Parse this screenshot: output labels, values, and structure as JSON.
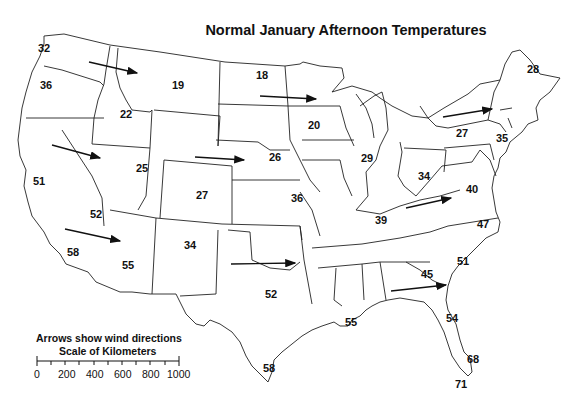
{
  "title": "Normal January Afternoon Temperatures",
  "legend": {
    "note": "Arrows show wind directions",
    "scale_title": "Scale of Kilometers",
    "scale_ticks": [
      "0",
      "200",
      "400",
      "600",
      "800",
      "1000"
    ]
  },
  "temperatures": [
    {
      "region": "washington",
      "value": "32",
      "x": 38,
      "y": 48
    },
    {
      "region": "oregon",
      "value": "36",
      "x": 40,
      "y": 81
    },
    {
      "region": "idaho",
      "value": "22",
      "x": 120,
      "y": 109
    },
    {
      "region": "montana",
      "value": "19",
      "x": 172,
      "y": 80
    },
    {
      "region": "north-dakota",
      "value": "18",
      "x": 256,
      "y": 70
    },
    {
      "region": "minnesota",
      "value": "20",
      "x": 308,
      "y": 120
    },
    {
      "region": "maine",
      "value": "28",
      "x": 527,
      "y": 64
    },
    {
      "region": "upstate-new-york",
      "value": "27",
      "x": 456,
      "y": 128
    },
    {
      "region": "new-york-city",
      "value": "35",
      "x": 496,
      "y": 133
    },
    {
      "region": "california-north",
      "value": "51",
      "x": 33,
      "y": 176
    },
    {
      "region": "utah",
      "value": "25",
      "x": 136,
      "y": 163
    },
    {
      "region": "nebraska",
      "value": "26",
      "x": 269,
      "y": 152
    },
    {
      "region": "colorado",
      "value": "27",
      "x": 196,
      "y": 190
    },
    {
      "region": "kansas",
      "value": "36",
      "x": 291,
      "y": 193
    },
    {
      "region": "nevada-south",
      "value": "52",
      "x": 90,
      "y": 209
    },
    {
      "region": "california-south",
      "value": "58",
      "x": 67,
      "y": 247
    },
    {
      "region": "arizona",
      "value": "55",
      "x": 122,
      "y": 260
    },
    {
      "region": "new-mexico",
      "value": "34",
      "x": 184,
      "y": 240
    },
    {
      "region": "illinois",
      "value": "29",
      "x": 361,
      "y": 153
    },
    {
      "region": "ohio",
      "value": "34",
      "x": 418,
      "y": 171
    },
    {
      "region": "west-virginia",
      "value": "40",
      "x": 466,
      "y": 184
    },
    {
      "region": "kentucky",
      "value": "39",
      "x": 375,
      "y": 215
    },
    {
      "region": "north-carolina",
      "value": "47",
      "x": 477,
      "y": 219
    },
    {
      "region": "south-carolina",
      "value": "51",
      "x": 457,
      "y": 256
    },
    {
      "region": "georgia",
      "value": "45",
      "x": 421,
      "y": 269
    },
    {
      "region": "texas",
      "value": "52",
      "x": 265,
      "y": 289
    },
    {
      "region": "louisiana",
      "value": "55",
      "x": 345,
      "y": 322
    },
    {
      "region": "north-florida",
      "value": "54",
      "x": 446,
      "y": 316
    },
    {
      "region": "south-florida",
      "value": "68",
      "x": 467,
      "y": 355
    },
    {
      "region": "key-west",
      "value": "71",
      "x": 455,
      "y": 379
    },
    {
      "region": "south-texas",
      "value": "58",
      "x": 263,
      "y": 366
    }
  ],
  "wind_arrows": [
    {
      "region": "northwest",
      "x1": 89,
      "y1": 62,
      "x2": 137,
      "y2": 73
    },
    {
      "region": "north-plains",
      "x1": 260,
      "y1": 96,
      "x2": 316,
      "y2": 99
    },
    {
      "region": "northeast",
      "x1": 443,
      "y1": 117,
      "x2": 492,
      "y2": 109
    },
    {
      "region": "great-basin",
      "x1": 52,
      "y1": 145,
      "x2": 100,
      "y2": 158
    },
    {
      "region": "central-plains",
      "x1": 195,
      "y1": 157,
      "x2": 244,
      "y2": 160
    },
    {
      "region": "appalachia",
      "x1": 406,
      "y1": 208,
      "x2": 451,
      "y2": 198
    },
    {
      "region": "southwest",
      "x1": 65,
      "y1": 229,
      "x2": 120,
      "y2": 241
    },
    {
      "region": "southern-plains",
      "x1": 231,
      "y1": 264,
      "x2": 295,
      "y2": 263
    },
    {
      "region": "southeast",
      "x1": 391,
      "y1": 291,
      "x2": 446,
      "y2": 285
    }
  ]
}
